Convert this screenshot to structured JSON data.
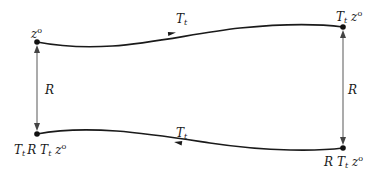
{
  "diagram": {
    "type": "commutative-loop",
    "nodes": [
      {
        "id": "top-left",
        "label": "z",
        "sup": "o",
        "x": 37,
        "y": 42
      },
      {
        "id": "top-right",
        "label_parts": [
          "T",
          "t",
          " z",
          "o"
        ],
        "text": "T_t z°",
        "x": 343,
        "y": 27
      },
      {
        "id": "bottom-left",
        "text": "T_t R T_t z°",
        "x": 37,
        "y": 134
      },
      {
        "id": "bottom-right",
        "text": "R T_t z°",
        "x": 343,
        "y": 148
      }
    ],
    "edges": [
      {
        "from": "top-left",
        "to": "top-right",
        "label": "T",
        "label_sub": "t",
        "direction": "right"
      },
      {
        "from": "bottom-right",
        "to": "bottom-left",
        "label": "T",
        "label_sub": "t",
        "direction": "left"
      },
      {
        "from": "top-left",
        "to": "bottom-left",
        "label": "R",
        "bidirectional": true
      },
      {
        "from": "top-right",
        "to": "bottom-right",
        "label": "R",
        "bidirectional": true
      }
    ],
    "labels": {
      "top_left_main": "z",
      "top_left_sup": "o",
      "top_right_T": "T",
      "top_right_Tsub": "t",
      "top_right_z": "z",
      "top_right_sup": "o",
      "bottom_left_T1": "T",
      "bottom_left_T1sub": "t",
      "bottom_left_R": "R",
      "bottom_left_T2": "T",
      "bottom_left_T2sub": "t",
      "bottom_left_z": "z",
      "bottom_left_sup": "o",
      "bottom_right_R": "R",
      "bottom_right_T": "T",
      "bottom_right_Tsub": "t",
      "bottom_right_z": "z",
      "bottom_right_sup": "o",
      "top_edge_T": "T",
      "top_edge_sub": "t",
      "bottom_edge_T": "T",
      "bottom_edge_sub": "t",
      "left_edge": "R",
      "right_edge": "R"
    },
    "colors": {
      "curve": "#1a1a1a",
      "vertical": "#555555",
      "dot": "#111111"
    }
  }
}
